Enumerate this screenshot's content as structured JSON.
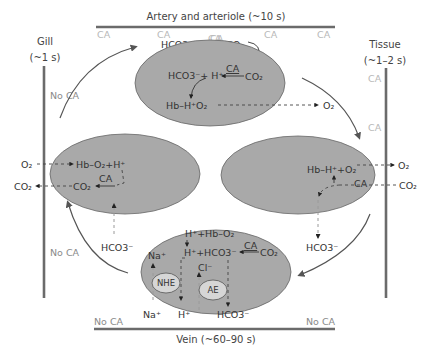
{
  "diagram": {
    "vessels": {
      "artery": {
        "label": "Artery and arteriole (~10 s)",
        "ca_marks": [
          "CA",
          "CA",
          "CA",
          "CA",
          "CA"
        ]
      },
      "tissue": {
        "label": "Tissue",
        "time": "(~1–2 s)",
        "ca_marks": [
          "CA",
          "CA"
        ]
      },
      "vein": {
        "label": "Vein (~60–90 s)",
        "ca_marks": [
          "No CA",
          "No CA"
        ]
      },
      "gill": {
        "label": "Gill",
        "time": "(~1 s)",
        "ca_marks": [
          "No CA",
          "No CA"
        ]
      }
    },
    "top_cell": {
      "plasma_reaction": {
        "left": "HCO3⁻+ H⁺",
        "enzyme": "CA",
        "right": "CO₂"
      },
      "inner_reaction": {
        "left": "HCO3⁻+ H⁺",
        "enzyme": "CA",
        "right": "CO₂"
      },
      "hb": "Hb–H⁺O₂",
      "out": "O₂"
    },
    "left_cell": {
      "o2_in": "O₂",
      "co2_out": "CO₂",
      "hb_reaction": "Hb–O₂+H⁺",
      "enzyme": "CA",
      "co2": "CO₂",
      "hco3_in": "HCO3⁻"
    },
    "right_cell": {
      "hb_reaction": "Hb–H⁺+O₂",
      "enzyme": "CA",
      "o2_out": "O₂",
      "co2_in": "CO₂",
      "hco3_out": "HCO3⁻"
    },
    "bottom_cell": {
      "hb_line": "H⁺+Hb–O₂",
      "h_hco3": "H⁺+HCO3⁻",
      "enzyme": "CA",
      "co2": "CO₂",
      "na_in": "Na⁺",
      "cl": "Cl⁻",
      "transporters": [
        "NHE",
        "AE"
      ],
      "outside": {
        "na": "Na⁺",
        "h": "H⁺",
        "hco3": "HCO3⁻"
      }
    },
    "hco3_flows": {
      "left": "HCO3⁻",
      "right": "HCO3⁻"
    }
  },
  "colors": {
    "cell_fill": "#a9a9a9",
    "transporter_fill": "#d6d6d6",
    "vessel_line": "#6b6b6b",
    "ca_text": "#b8b8b8",
    "text": "#333333"
  }
}
